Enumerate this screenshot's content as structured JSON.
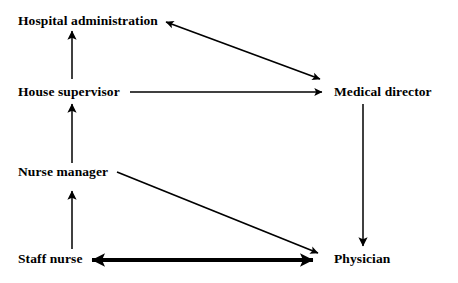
{
  "diagram": {
    "type": "directed-graph",
    "background_color": "#ffffff",
    "line_color": "#000000",
    "nodes": [
      {
        "id": "hospital-administration",
        "label": "Hospital administration",
        "x": 18,
        "y": 13
      },
      {
        "id": "house-supervisor",
        "label": "House supervisor",
        "x": 18,
        "y": 84
      },
      {
        "id": "nurse-manager",
        "label": "Nurse manager",
        "x": 18,
        "y": 164
      },
      {
        "id": "staff-nurse",
        "label": "Staff nurse",
        "x": 18,
        "y": 251
      },
      {
        "id": "medical-director",
        "label": "Medical director",
        "x": 334,
        "y": 84
      },
      {
        "id": "physician",
        "label": "Physician",
        "x": 334,
        "y": 251
      }
    ],
    "edges": [
      {
        "id": "house-supervisor-to-hospital-administration",
        "from": "house-supervisor",
        "to": "hospital-administration",
        "direction": "one-way",
        "style": "thin-vertical"
      },
      {
        "id": "nurse-manager-to-house-supervisor",
        "from": "nurse-manager",
        "to": "house-supervisor",
        "direction": "one-way",
        "style": "thin-vertical"
      },
      {
        "id": "staff-nurse-to-nurse-manager",
        "from": "staff-nurse",
        "to": "nurse-manager",
        "direction": "one-way",
        "style": "thin-vertical"
      },
      {
        "id": "hospital-administration-medical-director",
        "from": "hospital-administration",
        "to": "medical-director",
        "direction": "two-way",
        "style": "thin-diagonal"
      },
      {
        "id": "house-supervisor-to-medical-director",
        "from": "house-supervisor",
        "to": "medical-director",
        "direction": "one-way",
        "style": "thin-horizontal"
      },
      {
        "id": "medical-director-to-physician",
        "from": "medical-director",
        "to": "physician",
        "direction": "one-way",
        "style": "thin-vertical"
      },
      {
        "id": "nurse-manager-to-physician",
        "from": "nurse-manager",
        "to": "physician",
        "direction": "one-way",
        "style": "thin-diagonal"
      },
      {
        "id": "staff-nurse-physician",
        "from": "staff-nurse",
        "to": "physician",
        "direction": "two-way",
        "style": "thick-horizontal"
      }
    ]
  }
}
